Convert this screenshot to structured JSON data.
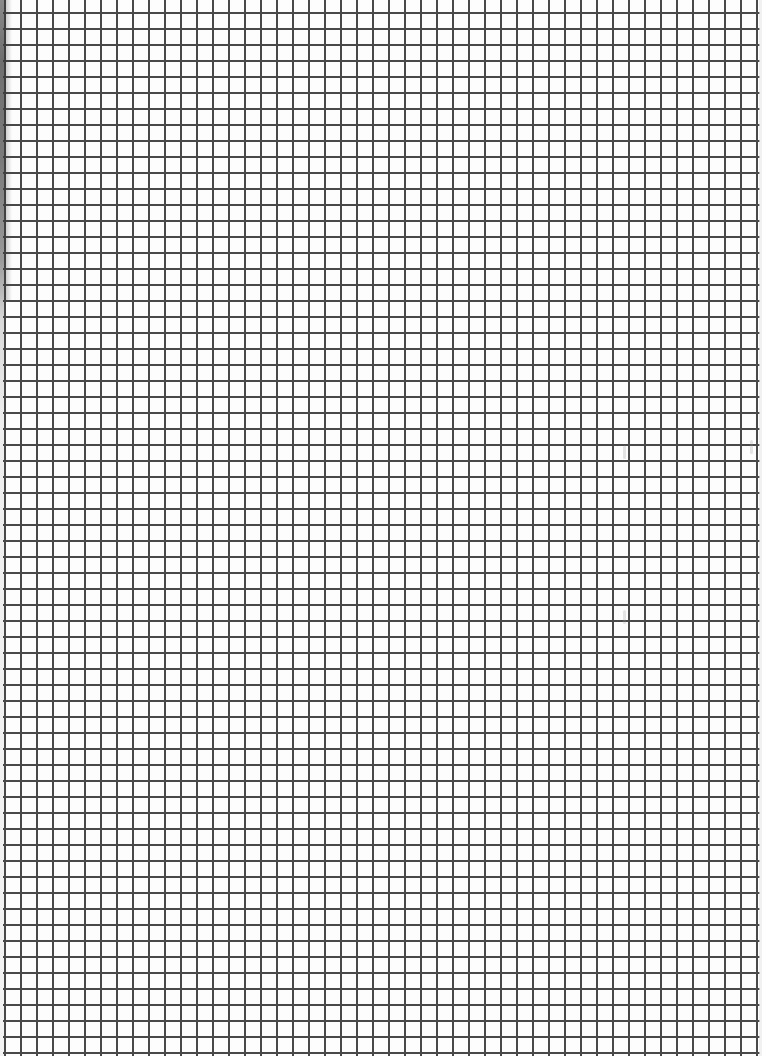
{
  "document": {
    "type": "graph-paper-scan",
    "grid": {
      "cell_size_px": 16,
      "line_color": "#3a3a3a",
      "background_color": "#fdfdfd",
      "columns": 47,
      "rows": 65
    },
    "edges": {
      "left_shadow": true,
      "left_shadow_color": "#6f6f6f"
    }
  }
}
